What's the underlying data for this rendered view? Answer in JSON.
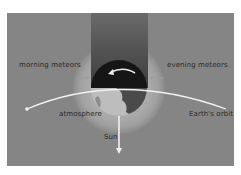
{
  "diagram": {
    "labels": {
      "morning": "morning meteors",
      "evening": "evening meteors",
      "atmosphere": "atmosphere",
      "orbit": "Earth's orbit",
      "sun": "Sun"
    },
    "colors": {
      "background": "#858585",
      "halo": "#a6a6a6",
      "shadow": "#3f3f3f",
      "earth_dark": "#1a1a1a",
      "earth_lit": "#bdbdbd",
      "orbit": "#f2f2f2",
      "text": "#2a2a2a"
    }
  }
}
